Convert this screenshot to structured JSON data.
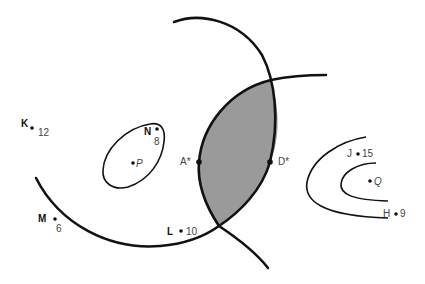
{
  "diagram": {
    "type": "contour-map",
    "colors": {
      "line": "#111111",
      "shaded_region": "#9a9a9a",
      "background": "#ffffff"
    },
    "points": [
      {
        "id": "K",
        "label": "K",
        "value": "12",
        "x": 32,
        "y": 128
      },
      {
        "id": "N",
        "label": "N",
        "value": "8",
        "x": 157,
        "y": 129
      },
      {
        "id": "P",
        "label": "P",
        "value": "",
        "x": 133,
        "y": 163
      },
      {
        "id": "M",
        "label": "M",
        "value": "6",
        "x": 55,
        "y": 219
      },
      {
        "id": "L",
        "label": "L",
        "value": "10",
        "x": 181,
        "y": 231
      },
      {
        "id": "A",
        "label": "A*",
        "value": "",
        "x": 199,
        "y": 162
      },
      {
        "id": "D",
        "label": "D*",
        "value": "",
        "x": 270,
        "y": 162
      },
      {
        "id": "J",
        "label": "J",
        "value": "15",
        "x": 358,
        "y": 154
      },
      {
        "id": "Q",
        "label": "Q",
        "value": "",
        "x": 370,
        "y": 181
      },
      {
        "id": "H",
        "label": "H",
        "value": "9",
        "x": 396,
        "y": 214
      }
    ],
    "labels": {
      "K": "K",
      "K_val": "12",
      "N": "N",
      "N_val": "8",
      "P": "P",
      "M": "M",
      "M_val": "6",
      "L": "L",
      "L_val": "10",
      "A": "A*",
      "D": "D*",
      "J": "J",
      "J_val": "15",
      "Q": "Q",
      "H": "H",
      "H_val": "9"
    },
    "curves": [
      {
        "name": "arc-1",
        "description": "large arc from top-left sweeping right and down"
      },
      {
        "name": "arc-2",
        "description": "large arc from left sweeping down and up to the right"
      },
      {
        "name": "loop-p",
        "description": "closed loop around P containing N"
      },
      {
        "name": "contour-q-outer",
        "description": "outer U-shaped contour around Q"
      },
      {
        "name": "contour-q-inner",
        "description": "inner U-shaped contour around Q"
      }
    ],
    "shaded_region": "lens-shaped intersection between arc-1 and arc-2, bounded by A* and D*"
  }
}
